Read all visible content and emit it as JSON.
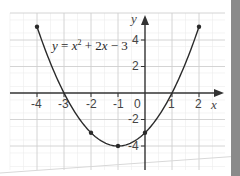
{
  "chart_data": {
    "type": "line",
    "equation_label": "y = x² + 2x − 3",
    "xlabel": "x",
    "ylabel": "y",
    "xlim": [
      -4,
      2
    ],
    "ylim": [
      -4,
      5
    ],
    "x_ticks": [
      "-4",
      "-3",
      "-2",
      "-1",
      "0",
      "1",
      "2"
    ],
    "y_ticks": [
      "4",
      "2",
      "-2",
      "-4"
    ],
    "grid": true,
    "legend": null,
    "series": [
      {
        "name": "y = x^2 + 2x - 3",
        "x": [
          -4,
          -3,
          -2,
          -1,
          0,
          1,
          2
        ],
        "y": [
          5,
          0,
          -3,
          -4,
          -3,
          0,
          5
        ],
        "marked_points": [
          [
            -4,
            5
          ],
          [
            -2,
            -3
          ],
          [
            -1,
            -4
          ],
          [
            0,
            -3
          ],
          [
            2,
            5
          ]
        ]
      }
    ]
  },
  "labels": {
    "eq_y": "y",
    "eq_eq": " = ",
    "eq_x": "x",
    "eq_sup": "2",
    "eq_rest": " + 2",
    "eq_x2": "x",
    "eq_tail": " − 3",
    "axis_x": "x",
    "axis_y": "y",
    "tick_x_m4": "-4",
    "tick_x_m3": "-3",
    "tick_x_m2": "-2",
    "tick_x_m1": "-1",
    "tick_x_0": "0",
    "tick_x_1": "1",
    "tick_x_2": "2",
    "tick_y_4": "4",
    "tick_y_2": "2",
    "tick_y_m2": "-2",
    "tick_y_m4": "-4"
  },
  "colors": {
    "curve": "#2a2a2a",
    "axis": "#333333",
    "grid_major": "#cfcfcf",
    "grid_minor": "#ececec",
    "side_band": "#8a8a8a"
  }
}
